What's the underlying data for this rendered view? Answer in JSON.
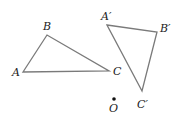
{
  "diagram": {
    "type": "geometry-rotation",
    "colors": {
      "stroke": "#7a7a7a",
      "text": "#222222",
      "point": "#111111"
    },
    "triangle_original": {
      "vertices": [
        {
          "label": "A",
          "x": 23,
          "y": 72,
          "lx": 12,
          "ly": 76
        },
        {
          "label": "B",
          "x": 47,
          "y": 35,
          "lx": 43,
          "ly": 30
        },
        {
          "label": "C",
          "x": 109,
          "y": 71,
          "lx": 113,
          "ly": 75
        }
      ]
    },
    "triangle_image": {
      "vertices": [
        {
          "label": "A′",
          "x": 107,
          "y": 25,
          "lx": 101,
          "ly": 20
        },
        {
          "label": "B′",
          "x": 157,
          "y": 32,
          "lx": 160,
          "ly": 32
        },
        {
          "label": "C′",
          "x": 142,
          "y": 91,
          "lx": 137,
          "ly": 108
        }
      ]
    },
    "center_point": {
      "label": "O",
      "x": 114,
      "y": 99,
      "lx": 109,
      "ly": 112
    }
  }
}
